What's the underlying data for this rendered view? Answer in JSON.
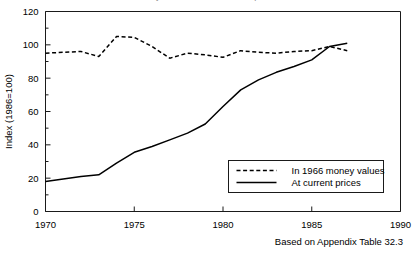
{
  "figure": {
    "clipped_title_fragment": "money values and at current prices",
    "caption": "Based on Appendix Table 32.3",
    "background_color": "#ffffff",
    "line_color": "#000000"
  },
  "chart_data": {
    "type": "line",
    "title": "",
    "xlabel": "",
    "ylabel": "Index (1986=100)",
    "xlim": [
      1970,
      1990
    ],
    "ylim": [
      0,
      120
    ],
    "ytick_values": [
      0,
      20,
      40,
      60,
      80,
      100,
      120
    ],
    "ytick_labels": [
      "0",
      "20",
      "40",
      "60",
      "80",
      "100",
      "120"
    ],
    "yminor_step": 10,
    "xtick_values": [
      1970,
      1975,
      1980,
      1985,
      1990
    ],
    "xtick_labels": [
      "1970",
      "1975",
      "1980",
      "1985",
      "1990"
    ],
    "grid": false,
    "legend_position": "lower right",
    "series": [
      {
        "name": "In 1966 money values",
        "style": "dashed",
        "color": "#000000",
        "x": [
          1970,
          1971,
          1972,
          1973,
          1974,
          1975,
          1976,
          1977,
          1978,
          1979,
          1980,
          1981,
          1982,
          1983,
          1984,
          1985,
          1986,
          1987
        ],
        "values": [
          95,
          95.5,
          96,
          93,
          105,
          104.5,
          99,
          92,
          95,
          94,
          92.5,
          96.5,
          95.5,
          95,
          96,
          96.5,
          99,
          96.5
        ]
      },
      {
        "name": "At current prices",
        "style": "solid",
        "color": "#000000",
        "x": [
          1970,
          1971,
          1972,
          1973,
          1974,
          1975,
          1976,
          1977,
          1978,
          1979,
          1980,
          1981,
          1982,
          1983,
          1984,
          1985,
          1986,
          1987
        ],
        "values": [
          18,
          19.5,
          21,
          22,
          29,
          35.5,
          39,
          43,
          47,
          52.5,
          63,
          73,
          79,
          83.5,
          87,
          91,
          99,
          101
        ]
      }
    ]
  },
  "legend": {
    "entries": [
      {
        "label": "In 1966 money values",
        "style": "dashed"
      },
      {
        "label": "At current prices",
        "style": "solid"
      }
    ]
  }
}
